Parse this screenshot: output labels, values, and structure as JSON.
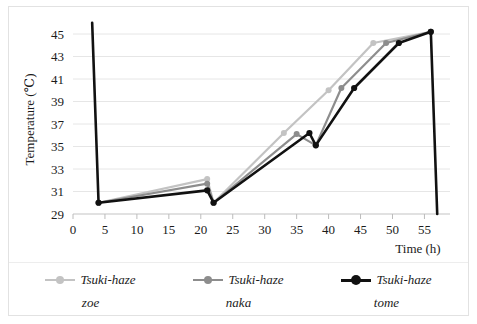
{
  "chart_data": {
    "type": "line",
    "title": "",
    "xlabel": "Time (h)",
    "ylabel": "Temperature (℃)",
    "xlim": [
      0,
      59
    ],
    "ylim": [
      29,
      45.8
    ],
    "xticks": [
      0,
      5,
      10,
      15,
      20,
      25,
      30,
      35,
      40,
      45,
      50,
      55
    ],
    "yticks": [
      29,
      31,
      33,
      35,
      37,
      39,
      41,
      43,
      45
    ],
    "grid": true,
    "legend_position": "bottom",
    "series": [
      {
        "name": "Tsuki-haze zoe",
        "label_main": "Tsuki-haze",
        "label_sub": "zoe",
        "color": "#c3c3c3",
        "marker": "circle",
        "x": [
          4,
          21,
          22,
          33,
          40,
          47,
          56
        ],
        "y": [
          30.0,
          32.1,
          30.0,
          36.2,
          40.0,
          44.2,
          45.2
        ]
      },
      {
        "name": "Tsuki-haze naka",
        "label_main": "Tsuki-haze",
        "label_sub": "naka",
        "color": "#8d8d8d",
        "marker": "circle",
        "x": [
          4,
          21,
          22,
          35,
          38,
          42,
          49,
          56
        ],
        "y": [
          30.0,
          31.7,
          30.0,
          36.1,
          35.1,
          40.2,
          44.2,
          45.2
        ]
      },
      {
        "name": "Tsuki-haze tome",
        "label_main": "Tsuki-haze",
        "label_sub": "tome",
        "color": "#111111",
        "marker": "circle",
        "x": [
          3,
          4,
          21,
          22,
          37,
          38,
          44,
          51,
          56,
          57
        ],
        "y": [
          46.0,
          30.0,
          31.1,
          30.0,
          36.2,
          35.1,
          40.2,
          44.2,
          45.2,
          29.0
        ]
      }
    ]
  },
  "axes": {
    "x_tick_labels": [
      "0",
      "5",
      "10",
      "15",
      "20",
      "25",
      "30",
      "35",
      "40",
      "45",
      "50",
      "55"
    ],
    "y_tick_labels": [
      "29",
      "31",
      "33",
      "35",
      "37",
      "39",
      "41",
      "43",
      "45"
    ],
    "x_axis_title": "Time (h)",
    "y_axis_title": "Temperature (℃)"
  },
  "legend": {
    "entries": [
      {
        "main": "Tsuki-haze",
        "sub": "zoe",
        "color": "#c3c3c3"
      },
      {
        "main": "Tsuki-haze",
        "sub": "naka",
        "color": "#8d8d8d"
      },
      {
        "main": "Tsuki-haze",
        "sub": "tome",
        "color": "#111111"
      }
    ]
  },
  "colors": {
    "grid": "#e6e6e6",
    "text": "#1b1b1b",
    "frame": "#e2e2e2",
    "series_light_gray": "#c3c3c3",
    "series_mid_gray": "#8d8d8d",
    "series_black": "#111111"
  }
}
